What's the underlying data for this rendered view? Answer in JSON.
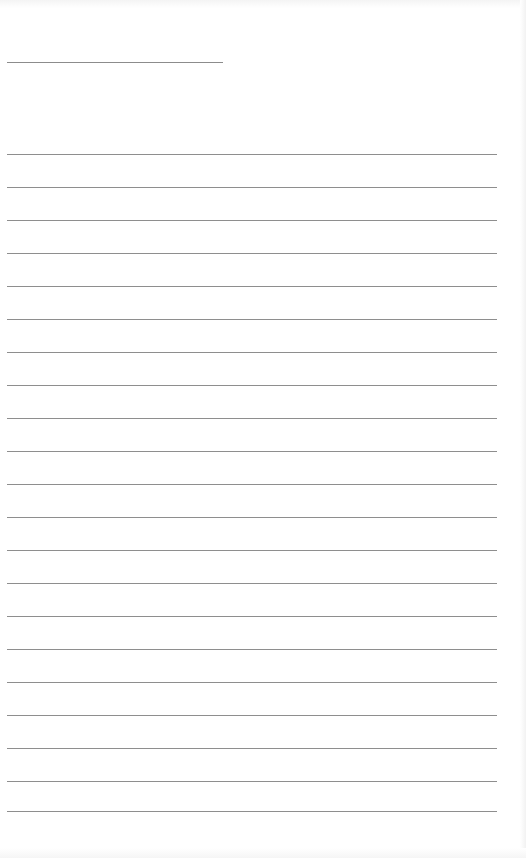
{
  "document": {
    "type": "blank lined form",
    "header_text": "",
    "colors": {
      "background": "#ffffff",
      "rule_line": "#8e8e8e"
    },
    "short_line": {
      "label": "",
      "value": ""
    },
    "ruled_lines": [
      {
        "top": 154,
        "value": ""
      },
      {
        "top": 187,
        "value": ""
      },
      {
        "top": 220,
        "value": ""
      },
      {
        "top": 253,
        "value": ""
      },
      {
        "top": 286,
        "value": ""
      },
      {
        "top": 319,
        "value": ""
      },
      {
        "top": 352,
        "value": ""
      },
      {
        "top": 385,
        "value": ""
      },
      {
        "top": 418,
        "value": ""
      },
      {
        "top": 451,
        "value": ""
      },
      {
        "top": 484,
        "value": ""
      },
      {
        "top": 517,
        "value": ""
      },
      {
        "top": 550,
        "value": ""
      },
      {
        "top": 583,
        "value": ""
      },
      {
        "top": 616,
        "value": ""
      },
      {
        "top": 649,
        "value": ""
      },
      {
        "top": 682,
        "value": ""
      },
      {
        "top": 715,
        "value": ""
      },
      {
        "top": 748,
        "value": ""
      },
      {
        "top": 781,
        "value": ""
      },
      {
        "top": 811,
        "value": ""
      }
    ]
  }
}
